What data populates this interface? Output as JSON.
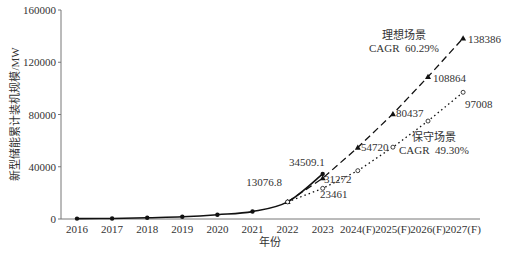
{
  "chart_data": {
    "type": "line",
    "title": "",
    "xlabel": "年份",
    "ylabel": "新型储能累计装机规模/MW",
    "ylim": [
      0,
      160000
    ],
    "yticks": [
      0,
      40000,
      80000,
      120000,
      160000
    ],
    "grid": false,
    "categories": [
      "2016",
      "2017",
      "2018",
      "2019",
      "2020",
      "2021",
      "2022",
      "2023",
      "2024(F)",
      "2025(F)",
      "2026(F)",
      "2027(F)"
    ],
    "series": [
      {
        "name": "历史数据",
        "style": "solid",
        "marker": "filled-circle",
        "values": [
          300,
          400,
          1000,
          1700,
          3300,
          5700,
          13076.8,
          34509.1,
          null,
          null,
          null,
          null
        ]
      },
      {
        "name": "理想场景",
        "style": "dashed",
        "marker": "filled-triangle",
        "cagr": "CAGR  60.29%",
        "values": [
          null,
          null,
          null,
          null,
          null,
          null,
          13076.8,
          31272,
          54720,
          80437,
          108864,
          138386
        ]
      },
      {
        "name": "保守场景",
        "style": "dotted",
        "marker": "open-circle",
        "cagr": "CAGR  49.30%",
        "values": [
          null,
          null,
          null,
          null,
          null,
          null,
          13076.8,
          23461,
          37000,
          55000,
          75000,
          97008
        ]
      }
    ],
    "annotations": [
      {
        "text": "13076.8",
        "x": "2022"
      },
      {
        "text": "34509.1",
        "x": "2023"
      },
      {
        "text": "31272",
        "x": "2023"
      },
      {
        "text": "23461",
        "x": "2023"
      },
      {
        "text": "54720",
        "x": "2024(F)"
      },
      {
        "text": "80437",
        "x": "2025(F)"
      },
      {
        "text": "108864",
        "x": "2026(F)"
      },
      {
        "text": "138386",
        "x": "2027(F)"
      },
      {
        "text": "97008",
        "x": "2027(F)"
      },
      {
        "text": "理想场景",
        "label": "scenario-ideal"
      },
      {
        "text": "保守场景",
        "label": "scenario-conservative"
      }
    ]
  },
  "labels": {
    "ideal_title": "理想场景",
    "ideal_cagr": "CAGR  60.29%",
    "cons_title": "保守场景",
    "cons_cagr": "CAGR  49.30%",
    "v2022": "13076.8",
    "v2023_actual": "34509.1",
    "v2023_ideal": "31272",
    "v2023_cons": "23461",
    "v2024_ideal": "54720",
    "v2025_ideal": "80437",
    "v2026_ideal": "108864",
    "v2027_ideal": "138386",
    "v2027_cons": "97008"
  }
}
